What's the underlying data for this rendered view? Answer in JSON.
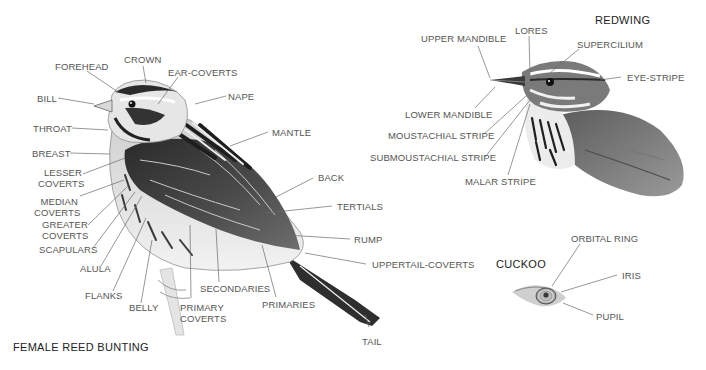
{
  "titles": {
    "bunting": "FEMALE REED BUNTING",
    "redwing": "REDWING",
    "cuckoo": "CUCKOO"
  },
  "bunting_labels": {
    "crown": "CROWN",
    "forehead": "FOREHEAD",
    "ear_coverts": "EAR-COVERTS",
    "bill": "BILL",
    "nape": "NAPE",
    "throat": "THROAT",
    "mantle": "MANTLE",
    "breast": "BREAST",
    "lesser_coverts_1": "LESSER",
    "lesser_coverts_2": "COVERTS",
    "median_coverts_1": "MEDIAN",
    "median_coverts_2": "COVERTS",
    "greater_coverts_1": "GREATER",
    "greater_coverts_2": "COVERTS",
    "scapulars": "SCAPULARS",
    "alula": "ALULA",
    "flanks": "FLANKS",
    "belly": "BELLY",
    "primary_coverts_1": "PRIMARY",
    "primary_coverts_2": "COVERTS",
    "secondaries": "SECONDARIES",
    "primaries": "PRIMARIES",
    "back": "BACK",
    "tertials": "TERTIALS",
    "rump": "RUMP",
    "uppertail_coverts": "UPPERTAIL-COVERTS",
    "tail": "TAIL"
  },
  "redwing_labels": {
    "upper_mandible": "UPPER MANDIBLE",
    "lores": "LORES",
    "supercilium": "SUPERCILIUM",
    "eye_stripe": "EYE-STRIPE",
    "lower_mandible": "LOWER MANDIBLE",
    "moustachial_stripe": "MOUSTACHIAL STRIPE",
    "submoustachial_stripe": "SUBMOUSTACHIAL STRIPE",
    "malar_stripe": "MALAR STRIPE"
  },
  "cuckoo_labels": {
    "orbital_ring": "ORBITAL RING",
    "iris": "IRIS",
    "pupil": "PUPIL"
  },
  "colors": {
    "label_text": "#555555",
    "title_text": "#222222",
    "leader_line": "#6a6a6a",
    "background": "#ffffff"
  }
}
